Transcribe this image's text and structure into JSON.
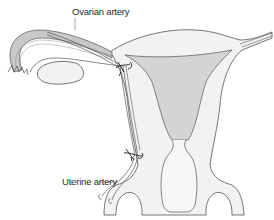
{
  "diagram": {
    "labels": {
      "ovarian_artery": "Ovarian artery",
      "uterine_artery": "Uterine artery"
    },
    "colors": {
      "outline": "#555555",
      "tissue_fill": "#f2f2f2",
      "cavity_fill": "#d4d4d4",
      "tube_fill": "#c8c8c8",
      "suture": "#1a1a1a"
    }
  }
}
